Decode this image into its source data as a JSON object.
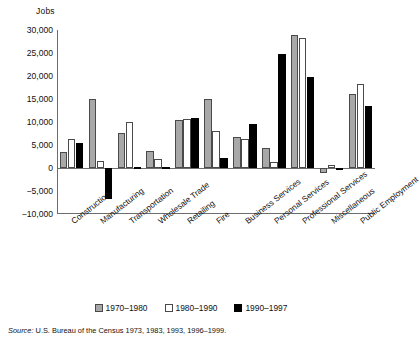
{
  "chart_data": {
    "type": "bar",
    "title": "",
    "ylabel": "Jobs",
    "xlabel": "",
    "ylim": [
      -10000,
      30000
    ],
    "yticks": [
      "30,000",
      "25,000",
      "20,000",
      "15,000",
      "10,000",
      "5,000",
      "0",
      "-5,000",
      "-10,000"
    ],
    "ytick_values": [
      30000,
      25000,
      20000,
      15000,
      10000,
      5000,
      0,
      -5000,
      -10000
    ],
    "grid": false,
    "legend_position": "bottom-center",
    "categories": [
      "Construction",
      "Manufacturing",
      "Transportation",
      "Wholesale Trade",
      "Retailing",
      "Fire",
      "Business Services",
      "Personal Services",
      "Professional Services",
      "Miscellaneous",
      "Public Employment"
    ],
    "series": [
      {
        "name": "1970-1980",
        "color": "#a8a8a8",
        "values": [
          3400,
          15000,
          7600,
          3800,
          10400,
          15000,
          6700,
          4300,
          29000,
          -1100,
          16000
        ]
      },
      {
        "name": "1980-1990",
        "color": "#ffffff",
        "values": [
          6400,
          1500,
          10000,
          2000,
          10700,
          8000,
          6400,
          1200,
          28200,
          700,
          18300
        ]
      },
      {
        "name": "1990-1997",
        "color": "#000000",
        "values": [
          5500,
          -6800,
          300,
          200,
          10900,
          2200,
          9600,
          24700,
          19800,
          -400,
          13500
        ]
      }
    ],
    "legend": [
      "1970-1980",
      "1980-1990",
      "1990-1997"
    ]
  },
  "source": {
    "prefix": "Source:",
    "text": "U.S. Bureau of the Census 1973, 1983, 1993, 1996-1999."
  }
}
